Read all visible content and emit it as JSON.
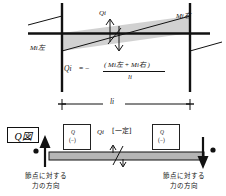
{
  "figure": {
    "title_box": "Q図",
    "top_panel": {
      "label_m_left": "Mi左",
      "label_m_right": "Mi右",
      "label_q_mid": "Qi",
      "formula": {
        "lhs": "Qi",
        "equals": "= −",
        "numerator": "( Mi左 + Mi右 )",
        "denominator": "li"
      }
    },
    "bottom_panel": {
      "span_label": "li",
      "center_label": "Qi",
      "center_bracket": "[一定]",
      "shear_box_left": {
        "symbol": "Q",
        "sign": "(−)"
      },
      "shear_box_right": {
        "symbol": "Q",
        "sign": "(−)"
      },
      "caption_left_line1": "節点に対する",
      "caption_left_line2": "力の方向",
      "caption_right_line1": "節点に対する",
      "caption_right_line2": "力の方向"
    }
  },
  "colors": {
    "line": "#111111",
    "shade": "#c9c9c9",
    "beam": "#b5b5b5",
    "background": "#ffffff"
  }
}
